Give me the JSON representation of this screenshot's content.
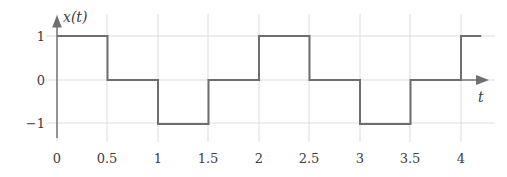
{
  "chart_data": {
    "type": "line",
    "title": "",
    "subtitle": "",
    "xlabel": "t",
    "ylabel": "x(t)",
    "grid": true,
    "legend": "none",
    "style": "square-wave step plot",
    "xlim": [
      0,
      4.2
    ],
    "ylim": [
      -1.35,
      1.35
    ],
    "x_ticks": [
      0,
      0.5,
      1,
      1.5,
      2,
      2.5,
      3,
      3.5,
      4
    ],
    "x_tick_labels": [
      "0",
      "0.5",
      "1",
      "1.5",
      "2",
      "2.5",
      "3",
      "3.5",
      "4"
    ],
    "y_ticks": [
      1,
      0,
      -1
    ],
    "y_tick_labels": [
      "1",
      "0",
      "−1"
    ],
    "series": [
      {
        "name": "x(t)",
        "color": "#6e6e6e",
        "segments": [
          {
            "x_start": 0,
            "x_end": 0.5,
            "value": 1
          },
          {
            "x_start": 0.5,
            "x_end": 1,
            "value": 0
          },
          {
            "x_start": 1,
            "x_end": 1.5,
            "value": -1
          },
          {
            "x_start": 1.5,
            "x_end": 2,
            "value": 0
          },
          {
            "x_start": 2,
            "x_end": 2.5,
            "value": 1
          },
          {
            "x_start": 2.5,
            "x_end": 3,
            "value": 0
          },
          {
            "x_start": 3,
            "x_end": 3.5,
            "value": -1
          },
          {
            "x_start": 3.5,
            "x_end": 4,
            "value": 0
          },
          {
            "x_start": 4,
            "x_end": 4.2,
            "value": 1
          }
        ],
        "x": [
          0,
          0.5,
          0.5,
          1,
          1,
          1.5,
          1.5,
          2,
          2,
          2.5,
          2.5,
          3,
          3,
          3.5,
          3.5,
          4,
          4,
          4.2
        ],
        "y": [
          1,
          1,
          0,
          0,
          -1,
          -1,
          0,
          0,
          1,
          1,
          0,
          0,
          -1,
          -1,
          0,
          0,
          1,
          1
        ]
      }
    ],
    "period": 2,
    "annotations": []
  },
  "axes": {
    "y_axis_label": "x(t)",
    "x_axis_label": "t",
    "y_arrow": "up-arrow",
    "x_arrow": "right-arrow"
  },
  "colors": {
    "signal": "#6e6e6e",
    "axis": "#6e6e6e",
    "grid": "#dcdcdc",
    "text": "#3d3d3d",
    "background": "#ffffff"
  }
}
